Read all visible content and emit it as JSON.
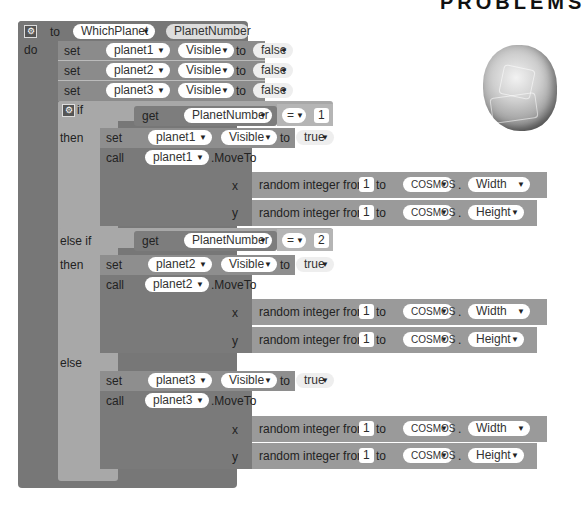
{
  "header_fragment": "PROBLEMS",
  "procedure": {
    "to_label": "to",
    "do_label": "do",
    "name": "WhichPlanet",
    "param": "PlanetNumber"
  },
  "initial_sets": [
    {
      "set": "set",
      "component": "planet1",
      "prop": "Visible",
      "to": "to",
      "value": "false"
    },
    {
      "set": "set",
      "component": "planet2",
      "prop": "Visible",
      "to": "to",
      "value": "false"
    },
    {
      "set": "set",
      "component": "planet3",
      "prop": "Visible",
      "to": "to",
      "value": "false"
    }
  ],
  "if_block": {
    "if_label": "if",
    "then_label": "then",
    "elseif_label": "else if",
    "else_label": "else",
    "get_label": "get",
    "op": "=",
    "branches": [
      {
        "var": "PlanetNumber",
        "compare": "1",
        "set_label": "set",
        "component": "planet1",
        "prop": "Visible",
        "to": "to",
        "value": "true",
        "call_label": "call",
        "method": ".MoveTo",
        "x_label": "x",
        "y_label": "y",
        "rand_label": "random integer from",
        "from": "1",
        "to_label": "to",
        "target": "COSMOS",
        "x_prop": "Width",
        "y_prop": "Height"
      },
      {
        "var": "PlanetNumber",
        "compare": "2",
        "set_label": "set",
        "component": "planet2",
        "prop": "Visible",
        "to": "to",
        "value": "true",
        "call_label": "call",
        "method": ".MoveTo",
        "x_label": "x",
        "y_label": "y",
        "rand_label": "random integer from",
        "from": "1",
        "to_label": "to",
        "target": "COSMOS",
        "x_prop": "Width",
        "y_prop": "Height"
      },
      {
        "set_label": "set",
        "component": "planet3",
        "prop": "Visible",
        "to": "to",
        "value": "true",
        "call_label": "call",
        "method": ".MoveTo",
        "x_label": "x",
        "y_label": "y",
        "rand_label": "random integer from",
        "from": "1",
        "to_label": "to",
        "target": "COSMOS",
        "x_prop": "Width",
        "y_prop": "Height"
      }
    ]
  },
  "dot": ".",
  "gear_glyph": "⚙",
  "dropdown_glyph": "▼"
}
